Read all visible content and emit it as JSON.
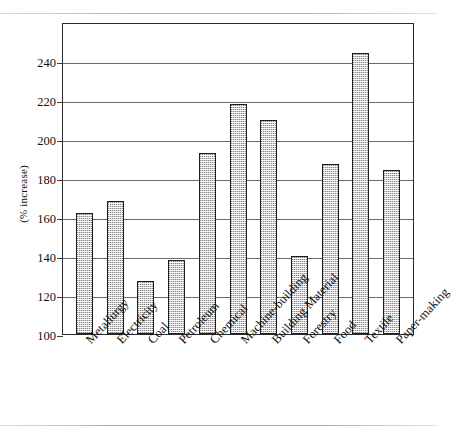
{
  "chart_data": {
    "type": "bar",
    "title": "",
    "xlabel": "",
    "ylabel": "(% increase)",
    "ylim": [
      100,
      260
    ],
    "ytick_labels": [
      "100",
      "120",
      "140",
      "160",
      "180",
      "200",
      "220",
      "240"
    ],
    "yticks": [
      100,
      120,
      140,
      160,
      180,
      200,
      220,
      240
    ],
    "grid": true,
    "legend": "none",
    "categories": [
      "Metallurgy",
      "Electricity",
      "Coal",
      "Petroleum",
      "Chemical",
      "Machine-building",
      "Building Material",
      "Forestry",
      "Food",
      "Textile",
      "Paper-making"
    ],
    "values": [
      162,
      168,
      127,
      138,
      193,
      218,
      210,
      140,
      187,
      244,
      184
    ],
    "bar_fill_color": "#d2d2d2",
    "bar_edge_color": "#1d1d1d",
    "axis_color": "#2b2b2b",
    "gridline_color": "#6a6a6a"
  }
}
